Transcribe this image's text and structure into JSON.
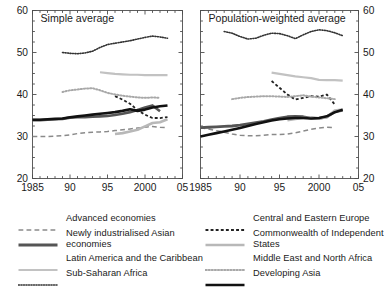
{
  "chart_data": {
    "type": "line",
    "title": "",
    "xlabel": "",
    "ylabel": "",
    "xlim": [
      1985,
      2005
    ],
    "ylim": [
      20,
      60
    ],
    "ytick_labels": [
      "20",
      "30",
      "40",
      "50",
      "60"
    ],
    "yticks": [
      20,
      30,
      40,
      50,
      60
    ],
    "yminor_step": 2.5,
    "xtick_labels": [
      "1985",
      "90",
      "95",
      "2000",
      "05"
    ],
    "xticks": [
      1985,
      1990,
      1995,
      2000,
      2005
    ],
    "xminor_step": 1,
    "grid": false,
    "legend_position": "bottom",
    "panels": [
      {
        "label": "Simple average",
        "series": [
          {
            "name": "Advanced economies",
            "style": "dashed",
            "color": "#8a8a8a",
            "width": 1.5,
            "x": [
              1985,
              1986,
              1987,
              1988,
              1989,
              1990,
              1991,
              1992,
              1993,
              1994,
              1995,
              1996,
              1997,
              1998,
              1999,
              2000,
              2001,
              2002,
              2003
            ],
            "y": [
              30.0,
              30.0,
              30.0,
              30.1,
              30.2,
              30.4,
              30.7,
              30.9,
              31.0,
              31.1,
              31.2,
              31.4,
              31.6,
              31.8,
              32.0,
              32.2,
              32.4,
              32.2,
              32.1
            ]
          },
          {
            "name": "Newly industrialised Asian economies",
            "style": "solid",
            "color": "#555555",
            "width": 2.6,
            "x": [
              1985,
              1986,
              1987,
              1988,
              1989,
              1990,
              1991,
              1992,
              1993,
              1994,
              1995,
              1996,
              1997,
              1998,
              1999,
              2000,
              2001,
              2002
            ],
            "y": [
              33.9,
              33.9,
              34.0,
              34.1,
              34.2,
              34.5,
              34.6,
              34.6,
              34.7,
              34.8,
              34.9,
              35.1,
              35.4,
              35.8,
              36.3,
              36.9,
              37.4,
              36.0
            ]
          },
          {
            "name": "Latin America and the Caribbean",
            "style": "solid",
            "color": "#c2c2c2",
            "width": 2.2,
            "x": [
              1994,
              1995,
              1996,
              1997,
              1998,
              1999,
              2000,
              2001,
              2002,
              2003
            ],
            "y": [
              45.3,
              45.1,
              44.9,
              44.8,
              44.7,
              44.7,
              44.6,
              44.6,
              44.6,
              44.6
            ]
          },
          {
            "name": "Sub-Saharan Africa",
            "style": "dotted",
            "color": "#333333",
            "width": 1.6,
            "x": [
              1989,
              1990,
              1991,
              1992,
              1993,
              1994,
              1995,
              1996,
              1997,
              1998,
              1999,
              2000,
              2001,
              2002,
              2003
            ],
            "y": [
              50.0,
              49.8,
              49.7,
              49.9,
              50.3,
              51.2,
              51.9,
              52.2,
              52.5,
              52.8,
              53.2,
              53.6,
              53.9,
              53.7,
              53.4
            ]
          },
          {
            "name": "Central and Eastern Europe",
            "style": "dashed-fine",
            "color": "#222222",
            "width": 1.8,
            "x": [
              1996,
              1997,
              1998,
              1999,
              2000,
              2001,
              2002,
              2003
            ],
            "y": [
              39.6,
              38.8,
              37.8,
              36.3,
              35.2,
              34.4,
              34.4,
              34.6
            ]
          },
          {
            "name": "Commonwealth of Independent States",
            "style": "solid",
            "color": "#b8b8b8",
            "width": 2.6,
            "x": [
              1996,
              1997,
              1998,
              1999,
              2000,
              2001,
              2002,
              2003
            ],
            "y": [
              30.6,
              30.8,
              31.2,
              31.6,
              32.4,
              33.2,
              33.4,
              34.1
            ]
          },
          {
            "name": "Middle East and North Africa",
            "style": "dotted",
            "color": "#a8a8a8",
            "width": 2.0,
            "x": [
              1989,
              1990,
              1991,
              1992,
              1993,
              1994,
              1995,
              1996,
              1997,
              1998,
              1999,
              2000,
              2001,
              2002
            ],
            "y": [
              40.6,
              41.0,
              41.2,
              41.4,
              41.5,
              41.0,
              40.4,
              40.0,
              39.7,
              39.5,
              39.3,
              39.2,
              39.3,
              39.2
            ]
          },
          {
            "name": "Developing Asia",
            "style": "solid",
            "color": "#111111",
            "width": 2.6,
            "x": [
              1985,
              1986,
              1987,
              1988,
              1989,
              1990,
              1991,
              1992,
              1993,
              1994,
              1995,
              1996,
              1997,
              1998,
              1999,
              2000,
              2001,
              2002,
              2003
            ],
            "y": [
              34.0,
              34.0,
              34.1,
              34.2,
              34.3,
              34.6,
              34.8,
              35.0,
              35.2,
              35.4,
              35.6,
              35.8,
              36.1,
              36.5,
              36.1,
              36.4,
              36.9,
              37.2,
              37.4
            ]
          }
        ]
      },
      {
        "label": "Population-weighted average",
        "series": [
          {
            "name": "Advanced economies",
            "style": "dashed",
            "color": "#8a8a8a",
            "width": 1.5,
            "x": [
              1985,
              1986,
              1987,
              1988,
              1989,
              1990,
              1991,
              1992,
              1993,
              1994,
              1995,
              1996,
              1997,
              1998,
              1999,
              2000,
              2001,
              2002
            ],
            "y": [
              32.1,
              31.8,
              31.4,
              31.0,
              30.6,
              30.3,
              30.2,
              30.2,
              30.3,
              30.5,
              30.5,
              30.6,
              30.9,
              31.3,
              31.7,
              32.0,
              32.2,
              32.1
            ]
          },
          {
            "name": "Newly industrialised Asian economies",
            "style": "solid",
            "color": "#555555",
            "width": 2.8,
            "x": [
              1985,
              1986,
              1987,
              1988,
              1989,
              1990,
              1991,
              1992,
              1993,
              1994,
              1995,
              1996,
              1997,
              1998,
              1999,
              2000,
              2001,
              2002,
              2003
            ],
            "y": [
              32.1,
              32.2,
              32.3,
              32.4,
              32.5,
              32.7,
              33.0,
              33.3,
              33.6,
              34.0,
              34.4,
              34.7,
              34.8,
              34.7,
              34.4,
              34.3,
              34.7,
              35.9,
              36.2
            ]
          },
          {
            "name": "Latin America and the Caribbean",
            "style": "solid",
            "color": "#c2c2c2",
            "width": 2.2,
            "x": [
              1994,
              1995,
              1996,
              1997,
              1998,
              1999,
              2000,
              2001,
              2002,
              2003
            ],
            "y": [
              45.2,
              44.9,
              44.6,
              44.3,
              44.1,
              43.9,
              43.5,
              43.4,
              43.4,
              43.3
            ]
          },
          {
            "name": "Sub-Saharan Africa",
            "style": "dotted",
            "color": "#333333",
            "width": 1.6,
            "x": [
              1988,
              1989,
              1990,
              1991,
              1992,
              1993,
              1994,
              1995,
              1996,
              1997,
              1998,
              1999,
              2000,
              2001,
              2002,
              2003
            ],
            "y": [
              55.0,
              54.6,
              53.8,
              53.2,
              53.4,
              54.1,
              54.6,
              54.5,
              54.0,
              53.3,
              54.2,
              55.0,
              55.4,
              55.2,
              54.7,
              54.0
            ]
          },
          {
            "name": "Central and Eastern Europe",
            "style": "dashed-fine",
            "color": "#222222",
            "width": 1.8,
            "x": [
              1994,
              1995,
              1996,
              1997,
              1998,
              1999,
              2000,
              2001,
              2002
            ],
            "y": [
              43.2,
              41.6,
              40.0,
              38.8,
              39.2,
              39.6,
              39.5,
              40.0,
              37.6
            ]
          },
          {
            "name": "Commonwealth of Independent States",
            "style": "solid",
            "color": "#b8b8b8",
            "width": 2.6,
            "x": [
              1996,
              1997,
              1998,
              1999,
              2000,
              2001,
              2002,
              2003
            ],
            "y": [
              33.9,
              34.2,
              34.4,
              34.4,
              34.3,
              34.6,
              36.2,
              36.4
            ]
          },
          {
            "name": "Middle East and North Africa",
            "style": "dotted",
            "color": "#a8a8a8",
            "width": 2.0,
            "x": [
              1989,
              1990,
              1991,
              1992,
              1993,
              1994,
              1995,
              1996,
              1997,
              1998,
              1999,
              2000,
              2001,
              2002
            ],
            "y": [
              38.9,
              39.2,
              39.4,
              39.5,
              39.6,
              39.6,
              39.5,
              39.4,
              39.6,
              39.8,
              39.5,
              39.3,
              39.1,
              38.9
            ]
          },
          {
            "name": "Developing Asia",
            "style": "solid",
            "color": "#111111",
            "width": 2.6,
            "x": [
              1985,
              1986,
              1987,
              1988,
              1989,
              1990,
              1991,
              1992,
              1993,
              1994,
              1995,
              1996,
              1997,
              1998,
              1999,
              2000,
              2001,
              2002,
              2003
            ],
            "y": [
              30.0,
              30.4,
              30.8,
              31.2,
              31.6,
              32.0,
              32.5,
              33.0,
              33.4,
              33.8,
              34.1,
              34.3,
              34.4,
              34.4,
              34.3,
              34.4,
              34.8,
              35.8,
              36.4
            ]
          }
        ]
      }
    ],
    "legend": {
      "left_column": [
        {
          "label": "Advanced economies",
          "style": "dashed",
          "color": "#8a8a8a",
          "width": 1.5
        },
        {
          "label": "Newly industrialised Asian economies",
          "style": "solid",
          "color": "#555555",
          "width": 2.8
        },
        {
          "label": "Latin America and the Caribbean",
          "style": "solid",
          "color": "#c2c2c2",
          "width": 2.2
        },
        {
          "label": "Sub-Saharan Africa",
          "style": "dotted",
          "color": "#333333",
          "width": 1.6
        }
      ],
      "right_column": [
        {
          "label": "Central and Eastern Europe",
          "style": "dashed-fine",
          "color": "#222222",
          "width": 1.8
        },
        {
          "label": "Commonwealth of Independent States",
          "style": "solid",
          "color": "#b8b8b8",
          "width": 2.6
        },
        {
          "label": "Middle East and North Africa",
          "style": "dotted",
          "color": "#a8a8a8",
          "width": 2.0
        },
        {
          "label": "Developing Asia",
          "style": "solid",
          "color": "#111111",
          "width": 2.6
        }
      ]
    }
  }
}
